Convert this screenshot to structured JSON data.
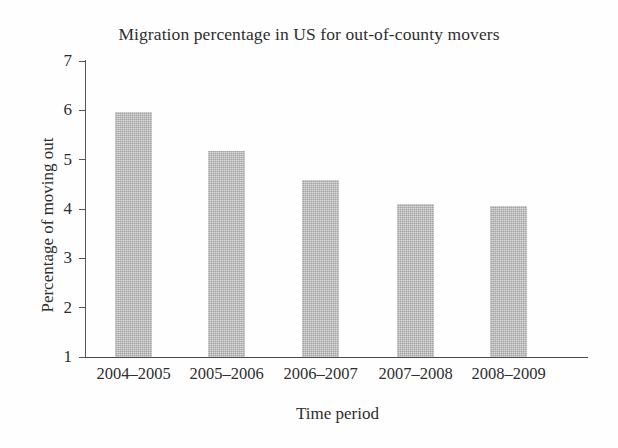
{
  "chart_data": {
    "type": "bar",
    "title": "Migration percentage in US for out-of-county movers",
    "xlabel": "Time period",
    "ylabel": "Percentage of moving out",
    "categories": [
      "2004–2005",
      "2005–2006",
      "2006–2007",
      "2007–2008",
      "2008–2009"
    ],
    "values": [
      5.97,
      5.17,
      4.59,
      4.1,
      4.07
    ],
    "ylim": [
      1,
      7
    ],
    "ytick_labels": [
      "7",
      "6",
      "5",
      "4",
      "3",
      "2",
      "1"
    ],
    "ytick_values": [
      7,
      6,
      5,
      4,
      3,
      2,
      1
    ],
    "grid": false,
    "legend": false,
    "bar_color": "#b6b6b6",
    "axis_color": "#4a4a4a",
    "text_color": "#2e2e2e",
    "background": "#fefefe"
  }
}
